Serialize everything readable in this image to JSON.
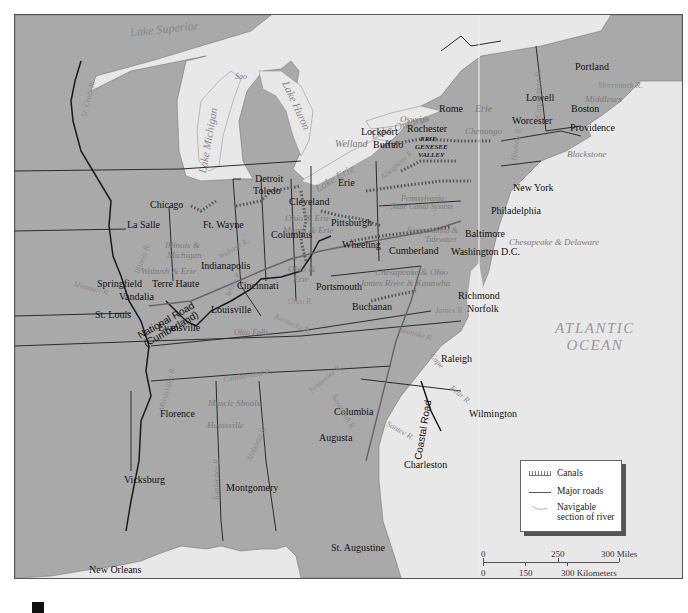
{
  "map": {
    "title_visible": false,
    "colors": {
      "land": "#a9a9a9",
      "water": "#e8e8e8",
      "border": "#2a2a2a",
      "canal": "#6f6f6f",
      "road": "#555555",
      "river": "#8a8a8a"
    }
  },
  "water_bodies": {
    "lake_superior": "Lake Superior",
    "lake_michigan": "Lake Michigan",
    "lake_huron": "Lake Huron",
    "lake_erie": "Lake Erie",
    "lake_ontario": "Lake Ontario",
    "atlantic_line1": "ATLANTIC",
    "atlantic_line2": "OCEAN",
    "gulf": "Gulf of Mexico"
  },
  "cities": {
    "portland": "Portland",
    "lowell": "Lowell",
    "boston": "Boston",
    "worcester": "Worcester",
    "providence": "Providence",
    "rome": "Rome",
    "rochester": "Rochester",
    "lockport": "Lockport",
    "buffalo": "Buffalo",
    "new_york": "New York",
    "philadelphia": "Philadelphia",
    "baltimore": "Baltimore",
    "washington": "Washington D.C.",
    "richmond": "Richmond",
    "norfolk": "Norfolk",
    "raleigh": "Raleigh",
    "wilmington": "Wilmington",
    "columbia": "Columbia",
    "augusta": "Augusta",
    "charleston": "Charleston",
    "st_augustine": "St. Augustine",
    "detroit": "Detroit",
    "toledo": "Toledo",
    "cleveland": "Cleveland",
    "erie": "Erie",
    "pittsburgh": "Pittsburgh",
    "wheeling": "Wheeling",
    "cumberland": "Cumberland",
    "columbus": "Columbus",
    "cincinnati": "Cincinnati",
    "portsmouth": "Portsmouth",
    "buchanan": "Buchanan",
    "chicago": "Chicago",
    "la_salle": "La Salle",
    "ft_wayne": "Ft. Wayne",
    "indianapolis": "Indianapolis",
    "terre_haute": "Terre Haute",
    "springfield": "Springfield",
    "vandalia": "Vandalia",
    "st_louis": "St. Louis",
    "evansville": "Evansville",
    "louisville": "Louisville",
    "florence": "Florence",
    "montgomery": "Montgomery",
    "vicksburg": "Vicksburg",
    "new_orleans": "New Orleans"
  },
  "canals": {
    "middlesex": "Middlesex",
    "blackstone": "Blackstone",
    "erie": "Erie",
    "oswego": "Oswego",
    "chenango": "Chenango",
    "welland": "Welland",
    "genesee_1": "ERIE",
    "genesee_2": "GENESEE",
    "genesee_3": "VALLEY",
    "penn_1": "Pennsylvania",
    "penn_2": "State Canal System",
    "susq_1": "Susquehanna &",
    "susq_2": "Tidewater",
    "ches_del": "Chesapeake & Delaware",
    "ches_ohio": "Chesapeake & Ohio",
    "james_kanawha": "James River & Kanawha",
    "ohio_erie": "Ohio & Erie",
    "miami_erie": "Miami & Erie",
    "ohio_erie_2a": "Ohio &",
    "ohio_erie_2b": "Erie",
    "wabash_erie": "Wabash & Erie",
    "illinois_mich_1": "Illinois &",
    "illinois_mich_2": "Michigan",
    "muscle_shoals": "Muscle Shoals",
    "huntsville": "Huntsville",
    "ohio_falls": "Ohio Falls",
    "sao": "Sao"
  },
  "rivers": {
    "st_croix": "St. Croix R.",
    "merrimack": "Merrimack R.",
    "connecticut": "Connecticut R.",
    "hudson": "Hudson R.",
    "allegheny": "Allegheny R.",
    "wabash": "Wabash R.",
    "illinois": "Illinois R.",
    "missouri": "Missouri R.",
    "ohio": "Ohio R.",
    "white": "White R.",
    "kentucky": "Kentucky R.",
    "james": "James R.",
    "roanoke": "Roanoke R.",
    "cape_fear": "Cape",
    "fear": "Fear R.",
    "cumberland": "Cumberland R.",
    "tennessee": "Tennessee R.",
    "mississippi": "Mississippi R.",
    "savannah": "Savannah R.",
    "santee": "Santee R.",
    "alabama": "Alabama R.",
    "tombigbee": "Tombigbee R."
  },
  "roads": {
    "national_1": "National Road",
    "national_2": "(Cumberland)",
    "coastal": "Coastal Road"
  },
  "legend": {
    "canals": "Canals",
    "roads": "Major roads",
    "river_1": "Navigable",
    "river_2": "section of river"
  },
  "scale": {
    "miles_0": "0",
    "miles_250": "250",
    "miles_300": "300 Miles",
    "km_0": "0",
    "km_150": "150",
    "km_300": "300 Kilometers"
  }
}
